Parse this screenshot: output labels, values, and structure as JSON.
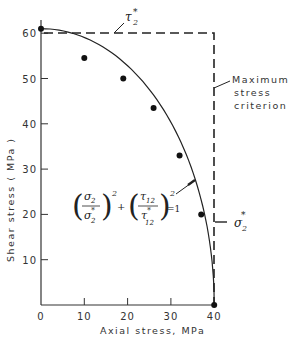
{
  "chart_data": {
    "type": "scatter",
    "title": "",
    "xlabel": "Axial stress, MPa",
    "ylabel": "Shear stress ( MPa )",
    "xlim": [
      0,
      40
    ],
    "ylim": [
      0,
      60
    ],
    "x_ticks": [
      "0",
      "10",
      "20",
      "30",
      "40"
    ],
    "y_ticks": [
      "10",
      "20",
      "30",
      "40",
      "50",
      "60"
    ],
    "grid": false,
    "series": [
      {
        "name": "Experimental data",
        "kind": "scatter",
        "points": [
          [
            0,
            61
          ],
          [
            10,
            54.5
          ],
          [
            19,
            50
          ],
          [
            26,
            43.5
          ],
          [
            32,
            33
          ],
          [
            37,
            20
          ],
          [
            40,
            0
          ]
        ]
      },
      {
        "name": "Tsai-Hill ellipse (σ2/σ2*)^2 + (τ12/τ12*)^2 = 1",
        "kind": "line",
        "sigma2_star": 40,
        "tau12_star": 61
      },
      {
        "name": "Maximum stress criterion",
        "kind": "dashed-rectangle",
        "sigma2_star": 40,
        "tau12_star": 61
      }
    ],
    "annotations": {
      "tau_star": "τ₂*",
      "max_stress": [
        "Maximum",
        "stress",
        "criterion"
      ],
      "sigma_star": "σ₂*",
      "equation": "(σ2/σ2*)^2 + (τ12/τ12*)^2 = 1"
    }
  }
}
